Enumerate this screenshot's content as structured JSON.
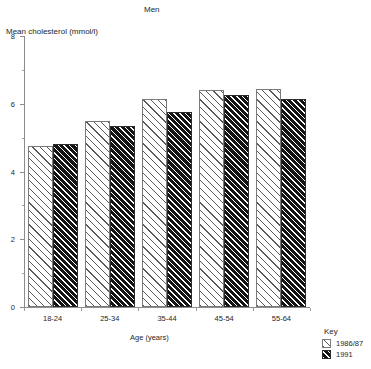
{
  "chart_data": {
    "type": "bar",
    "title": "Men",
    "xlabel": "Age (years)",
    "ylabel": "Mean cholesterol (mmol/l)",
    "categories": [
      "18-24",
      "25-34",
      "35-44",
      "45-54",
      "55-64"
    ],
    "series": [
      {
        "name": "1986/87",
        "values": [
          4.75,
          5.5,
          6.15,
          6.4,
          6.45
        ]
      },
      {
        "name": "1991",
        "values": [
          4.8,
          5.35,
          5.75,
          6.25,
          6.15
        ]
      }
    ],
    "ylim": [
      0,
      8
    ],
    "y_ticks": [
      0,
      2,
      4,
      6,
      8
    ],
    "y_tick_labels": [
      "0",
      "2",
      "4",
      "6",
      "8"
    ],
    "y_minor_ticks": [
      1,
      3,
      5,
      7
    ],
    "grid": false,
    "legend_position": "bottom-right"
  },
  "legend": {
    "title": "Key",
    "entries": [
      {
        "label": "1986/87",
        "pattern": "light-diagonal-hatch"
      },
      {
        "label": "1991",
        "pattern": "dark-diagonal-hatch"
      }
    ]
  },
  "colors": {
    "axis": "#8c8c8c",
    "text": "#262626",
    "series_1986_fill": "#ffffff",
    "series_1986_hatch": "#3c3c3c",
    "series_1991_fill": "#141414",
    "series_1991_hatch": "#ffffff",
    "background": "#ffffff"
  }
}
